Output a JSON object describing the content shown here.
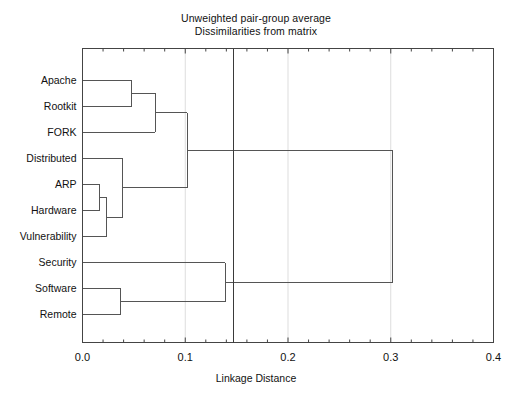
{
  "figure": {
    "title_lines": [
      "Unweighted pair-group average",
      "Dissimilarities from matrix"
    ],
    "xlabel": "Linkage Distance",
    "line_color": "#555555",
    "frame_color": "#444444",
    "grid_color": "#dddddd",
    "background": "#ffffff"
  },
  "chart_data": {
    "type": "dendrogram",
    "title": "Unweighted pair-group average\nDissimilarities from matrix",
    "xlabel": "Linkage Distance",
    "ylabel": "",
    "xlim": [
      0.0,
      0.4
    ],
    "xticks": [
      0.0,
      0.1,
      0.2,
      0.3,
      0.4
    ],
    "xtick_labels": [
      "0.0",
      "0.1",
      "0.2",
      "0.3",
      "0.4"
    ],
    "grid": true,
    "orientation": "horizontal",
    "linkage_method": "Unweighted pair-group average (UPGMA)",
    "leaves": [
      "Apache",
      "Rootkit",
      "FORK",
      "Distributed",
      "ARP",
      "Hardware",
      "Vulnerability",
      "Security",
      "Software",
      "Remote"
    ],
    "merges": [
      {
        "id": "m1",
        "members": [
          "Apache",
          "Rootkit"
        ],
        "distance": 0.048
      },
      {
        "id": "m2",
        "members": [
          "Apache",
          "Rootkit",
          "FORK"
        ],
        "distance": 0.071
      },
      {
        "id": "m3",
        "members": [
          "ARP",
          "Hardware"
        ],
        "distance": 0.017
      },
      {
        "id": "m4",
        "members": [
          "ARP",
          "Hardware",
          "Vulnerability"
        ],
        "distance": 0.023
      },
      {
        "id": "m5",
        "members": [
          "Distributed",
          "ARP",
          "Hardware",
          "Vulnerability"
        ],
        "distance": 0.039
      },
      {
        "id": "m6",
        "members": [
          "Apache",
          "Rootkit",
          "FORK",
          "Distributed",
          "ARP",
          "Hardware",
          "Vulnerability"
        ],
        "distance": 0.102
      },
      {
        "id": "m7",
        "members": [
          "Software",
          "Remote"
        ],
        "distance": 0.037
      },
      {
        "id": "m8",
        "members": [
          "Security",
          "Software",
          "Remote"
        ],
        "distance": 0.139
      },
      {
        "id": "m9",
        "members": [
          "Apache",
          "Rootkit",
          "FORK",
          "Distributed",
          "ARP",
          "Hardware",
          "Vulnerability",
          "Security",
          "Software",
          "Remote"
        ],
        "distance": 0.302
      }
    ],
    "cut_line": {
      "distance": 0.147,
      "label": ""
    },
    "annotations": []
  }
}
